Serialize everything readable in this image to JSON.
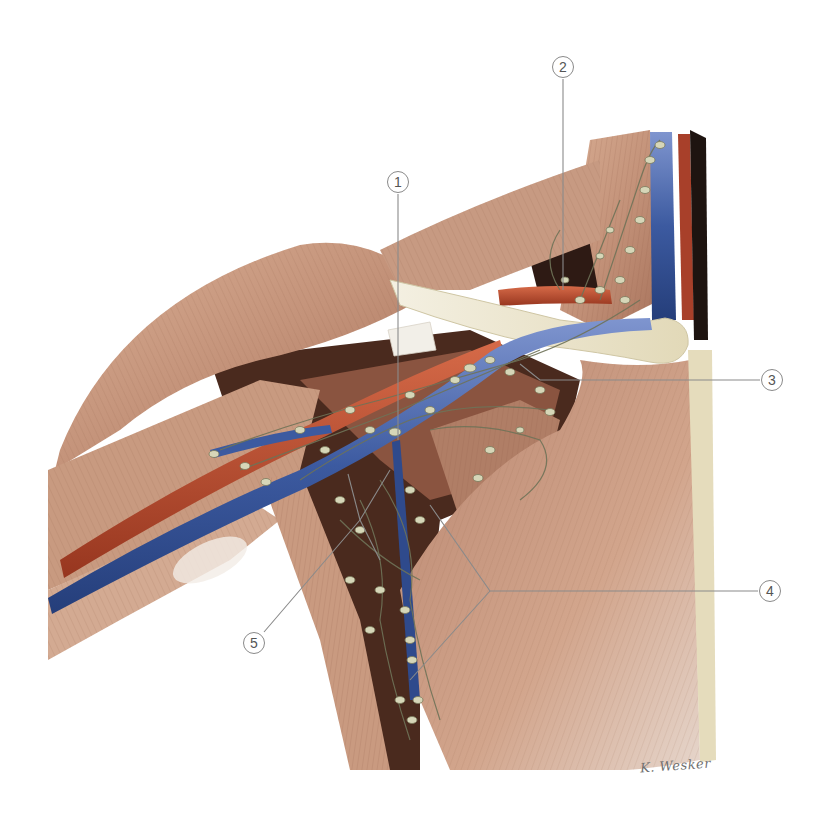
{
  "figure": {
    "colors": {
      "muscle": "#c89a80",
      "muscle_dark": "#9c6a55",
      "muscle_light": "#e2c2ac",
      "tendon": "#efe9dc",
      "bone_clavicle": "#e9e2c8",
      "artery": "#b4472c",
      "vein": "#3c5aa0",
      "vein_light": "#6d86c4",
      "lymph_node": "#d6d6b8",
      "lymph_vessel": "#6f7358",
      "cavity_dark": "#3a2218",
      "leader_line": "#8a8a8a",
      "background": "#ffffff"
    }
  },
  "labels": [
    {
      "id": 1,
      "text": "1",
      "x": 398,
      "y": 182
    },
    {
      "id": 2,
      "text": "2",
      "x": 563,
      "y": 67
    },
    {
      "id": 3,
      "text": "3",
      "x": 772,
      "y": 380
    },
    {
      "id": 4,
      "text": "4",
      "x": 770,
      "y": 591
    },
    {
      "id": 5,
      "text": "5",
      "x": 254,
      "y": 643
    }
  ],
  "signature": {
    "text": "K. Wesker"
  }
}
